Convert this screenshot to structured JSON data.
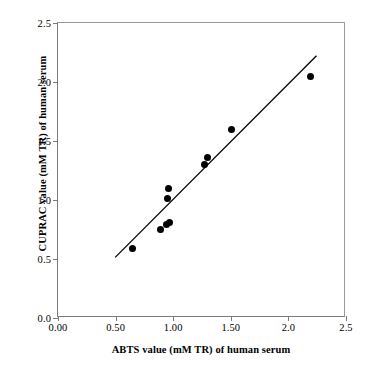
{
  "chart_data": {
    "type": "scatter",
    "title": "",
    "xlabel": "ABTS value (mM TR) of human serum",
    "ylabel": "CUPRAC value (mM TR) of human serum",
    "xlim": [
      0.0,
      2.5
    ],
    "ylim": [
      0.0,
      2.5
    ],
    "grid": false,
    "legend": "none",
    "xticks": [
      0.0,
      0.5,
      1.0,
      1.5,
      2.0,
      2.5
    ],
    "xtick_labels": [
      "0.00",
      "0.50",
      "1.00",
      "1.50",
      "2.0",
      "2.5"
    ],
    "yticks": [
      0.0,
      0.5,
      1.0,
      1.5,
      2.0,
      2.5
    ],
    "ytick_labels": [
      "0.0",
      "0.5",
      "1.0",
      "1.5",
      "2.0",
      "2.5"
    ],
    "series": [
      {
        "name": "human serum samples",
        "marker": "filled-circle",
        "color": "#000000",
        "points": [
          {
            "x": 0.65,
            "y": 0.59
          },
          {
            "x": 0.89,
            "y": 0.75
          },
          {
            "x": 0.94,
            "y": 0.79
          },
          {
            "x": 0.97,
            "y": 0.81
          },
          {
            "x": 0.95,
            "y": 1.01
          },
          {
            "x": 0.96,
            "y": 1.1
          },
          {
            "x": 1.27,
            "y": 1.3
          },
          {
            "x": 1.3,
            "y": 1.36
          },
          {
            "x": 1.51,
            "y": 1.6
          },
          {
            "x": 2.19,
            "y": 2.05
          }
        ]
      }
    ],
    "fit_line": {
      "name": "linear regression line",
      "color": "#000000",
      "x_start": 0.5,
      "y_start": 0.5,
      "x_end": 2.26,
      "y_end": 2.22
    }
  },
  "axes": {
    "x_title": "ABTS value (mM TR) of human serum",
    "y_title": "CUPRAC value (mM TR) of human serum"
  }
}
